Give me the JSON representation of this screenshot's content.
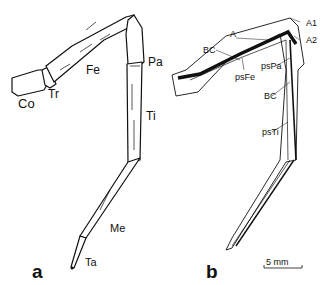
{
  "figure": {
    "panel_a": {
      "label": "a",
      "segments": [
        "Co",
        "Tr",
        "Fe",
        "Pa",
        "Ti",
        "Me",
        "Ta"
      ]
    },
    "panel_b": {
      "label": "b",
      "annotations": [
        "A",
        "A1",
        "A2",
        "BC",
        "psFe",
        "psPa",
        "BC",
        "psTi"
      ]
    },
    "scale_bar": "5 mm"
  }
}
